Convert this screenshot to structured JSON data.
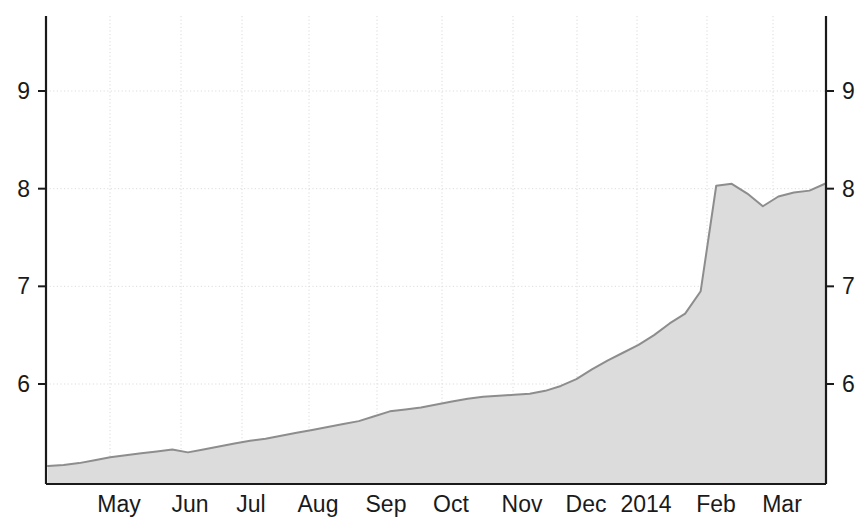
{
  "chart_data": {
    "type": "area",
    "title": "",
    "subtitle": "",
    "xlabel": "",
    "ylabel": "",
    "xlim_labels": [
      "May",
      "Mar"
    ],
    "ylim": [
      5.0,
      9.6
    ],
    "grid": true,
    "legend": null,
    "y_ticks": [
      "9",
      "8",
      "7",
      "6"
    ],
    "y_tick_values": [
      9,
      8,
      7,
      6
    ],
    "y_axis_right_ticks": [
      "9",
      "8",
      "7",
      "6"
    ],
    "x_ticks": [
      "May",
      "Jun",
      "Jul",
      "Aug",
      "Sep",
      "Oct",
      "Nov",
      "Dec",
      "2014",
      "Feb",
      "Mar"
    ],
    "series": [
      {
        "name": "series-1",
        "fill_color": "#dcdcdc",
        "line_color": "#8d8d8d",
        "x": [
          "2013-04-15",
          "2013-04-22",
          "2013-04-29",
          "2013-05-06",
          "2013-05-13",
          "2013-05-20",
          "2013-05-27",
          "2013-06-03",
          "2013-06-10",
          "2013-06-17",
          "2013-06-24",
          "2013-07-01",
          "2013-07-08",
          "2013-07-15",
          "2013-07-22",
          "2013-07-29",
          "2013-08-05",
          "2013-08-12",
          "2013-08-19",
          "2013-08-26",
          "2013-09-02",
          "2013-09-09",
          "2013-09-16",
          "2013-09-23",
          "2013-09-30",
          "2013-10-07",
          "2013-10-14",
          "2013-10-21",
          "2013-10-28",
          "2013-11-04",
          "2013-11-11",
          "2013-11-18",
          "2013-11-25",
          "2013-12-02",
          "2013-12-09",
          "2013-12-16",
          "2013-12-23",
          "2013-12-30",
          "2014-01-06",
          "2014-01-13",
          "2014-01-20",
          "2014-01-27",
          "2014-02-03",
          "2014-02-10",
          "2014-02-17",
          "2014-02-24",
          "2014-03-03",
          "2014-03-10",
          "2014-03-17",
          "2014-03-24",
          "2014-03-31"
        ],
        "values": [
          5.16,
          5.17,
          5.19,
          5.22,
          5.25,
          5.27,
          5.29,
          5.31,
          5.33,
          5.3,
          5.33,
          5.36,
          5.39,
          5.42,
          5.44,
          5.47,
          5.5,
          5.53,
          5.56,
          5.59,
          5.62,
          5.67,
          5.72,
          5.74,
          5.76,
          5.79,
          5.82,
          5.85,
          5.87,
          5.88,
          5.89,
          5.9,
          5.93,
          5.98,
          6.05,
          6.15,
          6.24,
          6.32,
          6.4,
          6.5,
          6.62,
          6.72,
          6.95,
          8.03,
          8.05,
          7.95,
          7.82,
          7.92,
          7.96,
          7.98,
          8.05
        ]
      }
    ],
    "annotations": []
  },
  "axes": {
    "left_ticks": [
      {
        "label": "9",
        "value": 9
      },
      {
        "label": "8",
        "value": 8
      },
      {
        "label": "7",
        "value": 7
      },
      {
        "label": "6",
        "value": 6
      }
    ],
    "right_ticks": [
      {
        "label": "9",
        "value": 9
      },
      {
        "label": "8",
        "value": 8
      },
      {
        "label": "7",
        "value": 7
      },
      {
        "label": "6",
        "value": 6
      }
    ],
    "x_ticks": [
      {
        "label": "May"
      },
      {
        "label": "Jun"
      },
      {
        "label": "Jul"
      },
      {
        "label": "Aug"
      },
      {
        "label": "Sep"
      },
      {
        "label": "Oct"
      },
      {
        "label": "Nov"
      },
      {
        "label": "Dec"
      },
      {
        "label": "2014"
      },
      {
        "label": "Feb"
      },
      {
        "label": "Mar"
      }
    ]
  },
  "colors": {
    "background": "#ffffff",
    "axis": "#1a1a1a",
    "grid": "#d9d9d9",
    "series_fill": "#dcdcdc",
    "series_line": "#8d8d8d",
    "text": "#1a1a1a"
  }
}
